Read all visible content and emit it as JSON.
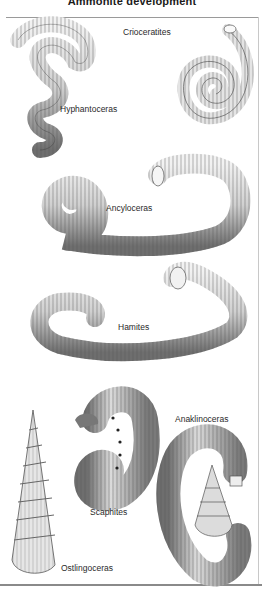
{
  "title": "Ammonite development",
  "specimens": [
    {
      "name": "Crioceratites",
      "icon": "coiled-shell-illustration"
    },
    {
      "name": "Hyphantoceras",
      "icon": "helical-shell-illustration"
    },
    {
      "name": "Ancyloceras",
      "icon": "hooked-spiral-shell-illustration"
    },
    {
      "name": "Hamites",
      "icon": "hook-shell-illustration"
    },
    {
      "name": "Anaklinoceras",
      "icon": "hooked-turreted-shell-illustration"
    },
    {
      "name": "Scaphites",
      "icon": "scaphitid-shell-illustration"
    },
    {
      "name": "Ostlingoceras",
      "icon": "turreted-shell-illustration"
    }
  ],
  "colors": {
    "ink": "#2a2a2a",
    "shade": "#8c8c8c",
    "paper": "#ffffff",
    "rule": "#9a9a9a"
  }
}
